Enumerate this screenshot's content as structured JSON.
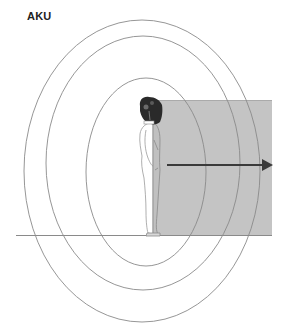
{
  "title": "AKU",
  "diagram": {
    "colors": {
      "shaded_region": "#c4c4c4",
      "ellipse_stroke": "#8a8a8a",
      "arrow": "#3a3a3a",
      "ground": "#8a8a8a",
      "figure_outline": "#9a9a9a",
      "headgear": "#2a2a2a"
    },
    "ellipses": [
      {
        "name": "outer",
        "cx": 142,
        "cy": 171,
        "rx": 118,
        "ry": 151
      },
      {
        "name": "middle",
        "cx": 143,
        "cy": 163,
        "rx": 97,
        "ry": 127
      },
      {
        "name": "inner",
        "cx": 146,
        "cy": 172,
        "rx": 60,
        "ry": 94
      }
    ],
    "shaded_region": {
      "x": 153,
      "y": 100,
      "width": 119,
      "height": 136
    },
    "arrow": {
      "x1": 167,
      "y1": 165,
      "x2": 272,
      "y2": 165,
      "direction": "right"
    },
    "ground_line": {
      "x1": 16,
      "y1": 235,
      "x2": 272,
      "y2": 235
    }
  }
}
